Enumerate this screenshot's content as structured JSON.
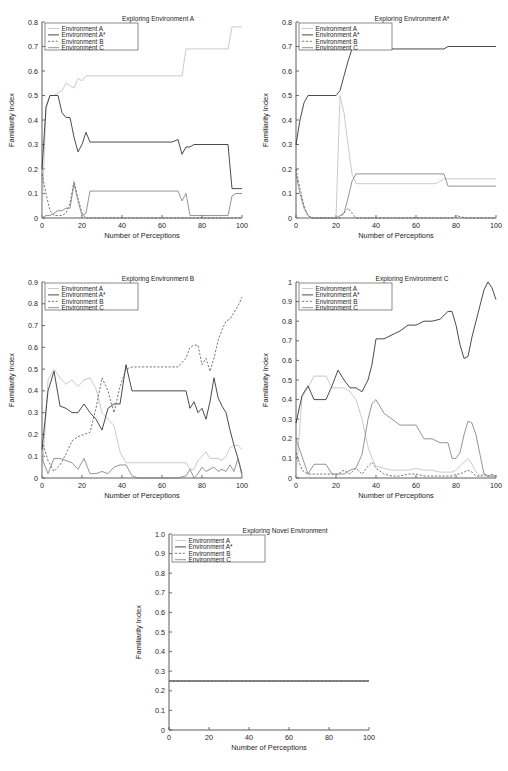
{
  "figure": {
    "panel_count": 5,
    "shared_xlabel": "Number of Perceptions",
    "shared_ylabel": "Familiarity Index",
    "legend_entries": [
      {
        "label": "Environment A",
        "style": "dotted-light",
        "color": "#bdbdbd"
      },
      {
        "label": "Environment A*",
        "style": "solid-dark",
        "color": "#2b2b2b"
      },
      {
        "label": "Environment B",
        "style": "dashed",
        "color": "#555555"
      },
      {
        "label": "Environment C",
        "style": "solid-gray",
        "color": "#7a7a7a"
      }
    ]
  },
  "chart_data": [
    {
      "type": "line",
      "title": "Exploring Environment A",
      "xlabel": "Number of Perceptions",
      "ylabel": "Familiarity Index",
      "xlim": [
        0,
        100
      ],
      "ylim": [
        0,
        0.8
      ],
      "xticks": [
        0,
        20,
        40,
        60,
        80,
        100
      ],
      "xticklabels": [
        "0",
        "20",
        "40",
        "60",
        "80",
        "100"
      ],
      "yticks": [
        0,
        0.1,
        0.2,
        0.3,
        0.4,
        0.5,
        0.6,
        0.7,
        0.8
      ],
      "yticklabels": [
        "0",
        "0.1",
        "0.2",
        "0.3",
        "0.4",
        "0.5",
        "0.6",
        "0.7",
        "0.8"
      ],
      "grid": false,
      "legend_position": "upper-left",
      "x": [
        0,
        2,
        4,
        6,
        8,
        10,
        12,
        14,
        16,
        18,
        20,
        22,
        24,
        26,
        28,
        30,
        35,
        40,
        45,
        50,
        55,
        60,
        65,
        68,
        70,
        72,
        74,
        76,
        78,
        80,
        85,
        90,
        93,
        95,
        97,
        100
      ],
      "series": [
        {
          "name": "Environment A",
          "values": [
            0.0,
            0.46,
            0.5,
            0.5,
            0.51,
            0.52,
            0.55,
            0.54,
            0.53,
            0.57,
            0.56,
            0.58,
            0.58,
            0.58,
            0.58,
            0.58,
            0.58,
            0.58,
            0.58,
            0.58,
            0.58,
            0.58,
            0.58,
            0.58,
            0.58,
            0.69,
            0.69,
            0.69,
            0.69,
            0.69,
            0.69,
            0.69,
            0.69,
            0.78,
            0.78,
            0.78
          ]
        },
        {
          "name": "Environment A*",
          "values": [
            0.2,
            0.45,
            0.5,
            0.5,
            0.5,
            0.43,
            0.41,
            0.41,
            0.33,
            0.27,
            0.3,
            0.35,
            0.31,
            0.31,
            0.31,
            0.31,
            0.31,
            0.31,
            0.31,
            0.31,
            0.31,
            0.31,
            0.31,
            0.32,
            0.26,
            0.29,
            0.29,
            0.3,
            0.3,
            0.3,
            0.3,
            0.3,
            0.3,
            0.12,
            0.12,
            0.12
          ]
        },
        {
          "name": "Environment B",
          "values": [
            0.18,
            0.1,
            0.03,
            0.01,
            0.01,
            0.01,
            0.02,
            0.06,
            0.15,
            0.08,
            0.02,
            0.0,
            0.0,
            0.0,
            0.0,
            0.0,
            0.0,
            0.0,
            0.0,
            0.0,
            0.0,
            0.0,
            0.0,
            0.0,
            0.0,
            0.0,
            0.0,
            0.0,
            0.0,
            0.0,
            0.0,
            0.0,
            0.0,
            0.0,
            0.0,
            0.0
          ]
        },
        {
          "name": "Environment C",
          "values": [
            0.0,
            0.01,
            0.01,
            0.02,
            0.03,
            0.03,
            0.04,
            0.04,
            0.14,
            0.07,
            0.01,
            0.02,
            0.11,
            0.11,
            0.11,
            0.11,
            0.11,
            0.11,
            0.11,
            0.11,
            0.11,
            0.11,
            0.11,
            0.11,
            0.07,
            0.1,
            0.01,
            0.01,
            0.01,
            0.01,
            0.01,
            0.01,
            0.01,
            0.09,
            0.1,
            0.1
          ]
        }
      ]
    },
    {
      "type": "line",
      "title": "Exploring Environment A*",
      "xlabel": "Number of Perceptions",
      "ylabel": "Familiarity Index",
      "xlim": [
        0,
        100
      ],
      "ylim": [
        0,
        0.8
      ],
      "xticks": [
        0,
        20,
        40,
        60,
        80,
        100
      ],
      "xticklabels": [
        "0",
        "20",
        "40",
        "60",
        "80",
        "100"
      ],
      "yticks": [
        0,
        0.1,
        0.2,
        0.3,
        0.4,
        0.5,
        0.6,
        0.7,
        0.8
      ],
      "yticklabels": [
        "0",
        "0.1",
        "0.2",
        "0.3",
        "0.4",
        "0.5",
        "0.6",
        "0.7",
        "0.8"
      ],
      "grid": false,
      "legend_position": "upper-left",
      "x": [
        0,
        2,
        4,
        6,
        8,
        12,
        16,
        20,
        22,
        24,
        26,
        28,
        30,
        35,
        40,
        45,
        50,
        55,
        60,
        65,
        70,
        74,
        76,
        78,
        80,
        85,
        90,
        95,
        100
      ],
      "series": [
        {
          "name": "Environment A",
          "values": [
            0.0,
            0.0,
            0.0,
            0.0,
            0.0,
            0.0,
            0.0,
            0.0,
            0.5,
            0.43,
            0.3,
            0.18,
            0.14,
            0.14,
            0.14,
            0.14,
            0.14,
            0.14,
            0.14,
            0.14,
            0.14,
            0.16,
            0.16,
            0.16,
            0.16,
            0.16,
            0.16,
            0.16,
            0.16
          ]
        },
        {
          "name": "Environment A*",
          "values": [
            0.3,
            0.4,
            0.47,
            0.5,
            0.5,
            0.5,
            0.5,
            0.5,
            0.52,
            0.58,
            0.64,
            0.69,
            0.69,
            0.69,
            0.69,
            0.69,
            0.69,
            0.69,
            0.69,
            0.69,
            0.69,
            0.69,
            0.7,
            0.7,
            0.7,
            0.7,
            0.7,
            0.7,
            0.7
          ]
        },
        {
          "name": "Environment B",
          "values": [
            0.2,
            0.12,
            0.05,
            0.01,
            0.0,
            0.0,
            0.0,
            0.0,
            0.0,
            0.02,
            0.04,
            0.02,
            0.0,
            0.0,
            0.0,
            0.0,
            0.0,
            0.0,
            0.0,
            0.0,
            0.0,
            0.0,
            0.0,
            0.0,
            0.01,
            0.0,
            0.0,
            0.0,
            0.0
          ]
        },
        {
          "name": "Environment C",
          "values": [
            0.18,
            0.1,
            0.04,
            0.01,
            0.0,
            0.0,
            0.0,
            0.0,
            0.01,
            0.02,
            0.08,
            0.15,
            0.18,
            0.18,
            0.18,
            0.18,
            0.18,
            0.18,
            0.18,
            0.18,
            0.18,
            0.18,
            0.13,
            0.13,
            0.13,
            0.13,
            0.13,
            0.13,
            0.13
          ]
        }
      ]
    },
    {
      "type": "line",
      "title": "Exploring Environment B",
      "xlabel": "Number of Perceptions",
      "ylabel": "Familiarity Index",
      "xlim": [
        0,
        100
      ],
      "ylim": [
        0,
        0.9
      ],
      "xticks": [
        0,
        20,
        40,
        60,
        80,
        100
      ],
      "xticklabels": [
        "0",
        "20",
        "40",
        "60",
        "80",
        "100"
      ],
      "yticks": [
        0,
        0.1,
        0.2,
        0.3,
        0.4,
        0.5,
        0.6,
        0.7,
        0.8,
        0.9
      ],
      "yticklabels": [
        "0",
        "0.1",
        "0.2",
        "0.3",
        "0.4",
        "0.5",
        "0.6",
        "0.7",
        "0.8",
        "0.9"
      ],
      "grid": false,
      "legend_position": "upper-left",
      "x": [
        0,
        3,
        6,
        9,
        12,
        15,
        18,
        21,
        24,
        27,
        30,
        33,
        36,
        39,
        42,
        45,
        48,
        52,
        56,
        60,
        64,
        68,
        72,
        74,
        76,
        78,
        80,
        82,
        84,
        86,
        88,
        90,
        92,
        94,
        96,
        98,
        100
      ],
      "series": [
        {
          "name": "Environment A",
          "values": [
            0.0,
            0.45,
            0.5,
            0.46,
            0.43,
            0.45,
            0.42,
            0.45,
            0.46,
            0.41,
            0.3,
            0.27,
            0.24,
            0.12,
            0.07,
            0.07,
            0.07,
            0.07,
            0.07,
            0.07,
            0.07,
            0.07,
            0.07,
            0.04,
            0.04,
            0.08,
            0.1,
            0.12,
            0.09,
            0.09,
            0.09,
            0.08,
            0.1,
            0.14,
            0.15,
            0.15,
            0.13
          ]
        },
        {
          "name": "Environment A*",
          "values": [
            0.13,
            0.4,
            0.49,
            0.33,
            0.32,
            0.3,
            0.3,
            0.34,
            0.3,
            0.27,
            0.22,
            0.32,
            0.34,
            0.34,
            0.52,
            0.4,
            0.4,
            0.4,
            0.4,
            0.4,
            0.4,
            0.4,
            0.4,
            0.32,
            0.35,
            0.3,
            0.32,
            0.27,
            0.35,
            0.46,
            0.37,
            0.33,
            0.3,
            0.22,
            0.15,
            0.09,
            0.02
          ]
        },
        {
          "name": "Environment B",
          "values": [
            0.17,
            0.08,
            0.03,
            0.06,
            0.11,
            0.17,
            0.19,
            0.2,
            0.21,
            0.32,
            0.46,
            0.4,
            0.3,
            0.42,
            0.5,
            0.51,
            0.51,
            0.51,
            0.51,
            0.51,
            0.51,
            0.51,
            0.55,
            0.6,
            0.61,
            0.61,
            0.52,
            0.55,
            0.49,
            0.55,
            0.63,
            0.68,
            0.72,
            0.73,
            0.76,
            0.79,
            0.83
          ]
        },
        {
          "name": "Environment C",
          "values": [
            0.09,
            0.02,
            0.09,
            0.09,
            0.08,
            0.07,
            0.04,
            0.09,
            0.02,
            0.02,
            0.03,
            0.02,
            0.05,
            0.06,
            0.06,
            0.01,
            0.0,
            0.0,
            0.0,
            0.0,
            0.0,
            0.0,
            0.01,
            0.04,
            0.0,
            0.02,
            0.05,
            0.03,
            0.04,
            0.05,
            0.03,
            0.04,
            0.03,
            0.06,
            0.03,
            0.09,
            0.01
          ]
        }
      ]
    },
    {
      "type": "line",
      "title": "Exploring Environment C",
      "xlabel": "Number of Perceptions",
      "ylabel": "Familiarity Index",
      "xlim": [
        0,
        100
      ],
      "ylim": [
        0,
        1
      ],
      "xticks": [
        0,
        20,
        40,
        60,
        80,
        100
      ],
      "xticklabels": [
        "0",
        "20",
        "40",
        "60",
        "80",
        "100"
      ],
      "yticks": [
        0,
        0.1,
        0.2,
        0.3,
        0.4,
        0.5,
        0.6,
        0.7,
        0.8,
        0.9,
        1
      ],
      "yticklabels": [
        "0",
        "0.1",
        "0.2",
        "0.3",
        "0.4",
        "0.5",
        "0.6",
        "0.7",
        "0.8",
        "0.9",
        "1"
      ],
      "grid": false,
      "legend_position": "upper-left",
      "x": [
        0,
        3,
        6,
        9,
        12,
        15,
        18,
        21,
        24,
        27,
        30,
        33,
        36,
        38,
        40,
        44,
        48,
        52,
        56,
        60,
        64,
        68,
        72,
        76,
        78,
        80,
        82,
        84,
        86,
        88,
        90,
        92,
        94,
        96,
        98,
        100
      ],
      "series": [
        {
          "name": "Environment A",
          "values": [
            0.0,
            0.41,
            0.46,
            0.52,
            0.52,
            0.52,
            0.46,
            0.46,
            0.46,
            0.44,
            0.4,
            0.3,
            0.16,
            0.1,
            0.06,
            0.05,
            0.04,
            0.04,
            0.04,
            0.05,
            0.04,
            0.04,
            0.03,
            0.03,
            0.03,
            0.04,
            0.06,
            0.08,
            0.1,
            0.07,
            0.03,
            0.01,
            0.01,
            0.01,
            0.01,
            0.01
          ]
        },
        {
          "name": "Environment A*",
          "values": [
            0.28,
            0.42,
            0.47,
            0.4,
            0.4,
            0.4,
            0.47,
            0.55,
            0.5,
            0.46,
            0.46,
            0.44,
            0.5,
            0.58,
            0.71,
            0.71,
            0.73,
            0.75,
            0.78,
            0.78,
            0.8,
            0.8,
            0.81,
            0.85,
            0.85,
            0.78,
            0.68,
            0.61,
            0.62,
            0.72,
            0.8,
            0.88,
            0.96,
            1.0,
            0.97,
            0.91
          ]
        },
        {
          "name": "Environment B",
          "values": [
            0.13,
            0.04,
            0.02,
            0.02,
            0.02,
            0.02,
            0.02,
            0.02,
            0.04,
            0.02,
            0.05,
            0.02,
            0.06,
            0.08,
            0.05,
            0.02,
            0.01,
            0.01,
            0.02,
            0.02,
            0.01,
            0.01,
            0.01,
            0.01,
            0.01,
            0.02,
            0.02,
            0.03,
            0.04,
            0.03,
            0.01,
            0.01,
            0.02,
            0.01,
            0.02,
            0.01
          ]
        },
        {
          "name": "Environment C",
          "values": [
            0.2,
            0.11,
            0.02,
            0.07,
            0.07,
            0.07,
            0.02,
            0.02,
            0.02,
            0.04,
            0.05,
            0.12,
            0.3,
            0.38,
            0.4,
            0.33,
            0.3,
            0.27,
            0.27,
            0.27,
            0.2,
            0.2,
            0.18,
            0.18,
            0.1,
            0.1,
            0.13,
            0.22,
            0.29,
            0.28,
            0.22,
            0.12,
            0.02,
            0.01,
            0.01,
            0.01
          ]
        }
      ]
    },
    {
      "type": "line",
      "title": "Exploring Novel Environment",
      "xlabel": "Number of Perceptions",
      "ylabel": "Familiarity Index",
      "xlim": [
        0,
        100
      ],
      "ylim": [
        0,
        1.0
      ],
      "xticks": [
        0,
        20,
        40,
        60,
        80,
        100
      ],
      "xticklabels": [
        "0",
        "20",
        "40",
        "60",
        "80",
        "100"
      ],
      "yticks": [
        0,
        0.1,
        0.2,
        0.3,
        0.4,
        0.5,
        0.6,
        0.7,
        0.8,
        0.9,
        1.0
      ],
      "yticklabels": [
        "0",
        "0.1",
        "0.2",
        "0.3",
        "0.4",
        "0.5",
        "0.6",
        "0.7",
        "0.8",
        "0.9",
        "1.0"
      ],
      "grid": false,
      "legend_position": "upper-left",
      "x": [
        0,
        100
      ],
      "series": [
        {
          "name": "Environment A",
          "values": [
            0.25,
            0.25
          ]
        },
        {
          "name": "Environment A*",
          "values": [
            0.25,
            0.25
          ]
        },
        {
          "name": "Environment B",
          "values": [
            0.25,
            0.25
          ]
        },
        {
          "name": "Environment C",
          "values": [
            0.25,
            0.25
          ]
        }
      ]
    }
  ]
}
